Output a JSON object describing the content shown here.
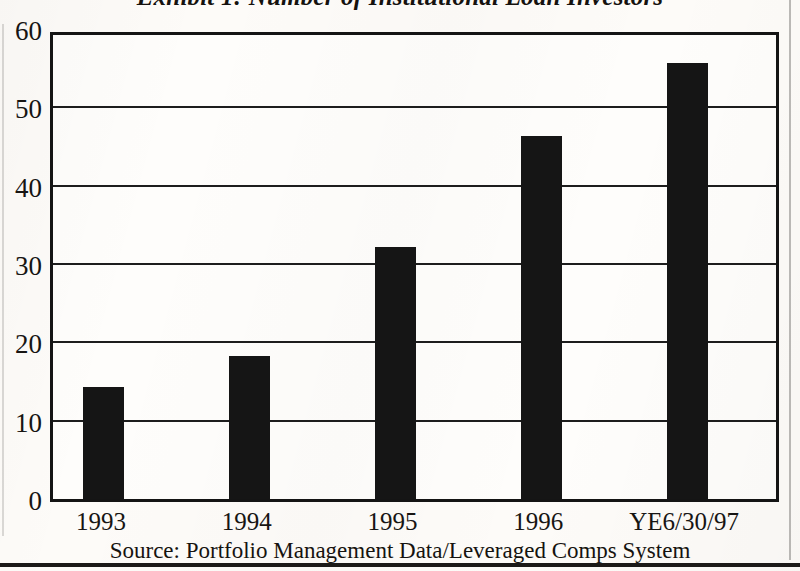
{
  "document": {
    "title": "Exhibit 1: Number of Institutional Loan Investors",
    "source_note": "Source: Portfolio Management Data/Leveraged Comps System"
  },
  "chart_data": {
    "type": "bar",
    "title": "Exhibit 1: Number of Institutional Loan Investors",
    "subtitle": "",
    "categories": [
      "1993",
      "1994",
      "1995",
      "1996",
      "YE6/30/97"
    ],
    "values": [
      14.3,
      18.3,
      32.2,
      46.3,
      55.6
    ],
    "series": [
      {
        "name": "Number of Institutional Loan Investors",
        "values": [
          14.3,
          18.3,
          32.2,
          46.3,
          55.6
        ]
      }
    ],
    "xlabel": "",
    "ylabel": "",
    "ylim": [
      0,
      60
    ],
    "yticks": [
      0,
      10,
      20,
      30,
      40,
      50,
      60
    ],
    "ytick_labels": [
      "0",
      "10",
      "20",
      "30",
      "40",
      "50",
      "60"
    ],
    "grid": true,
    "grid_axis": "y",
    "legend": false,
    "legend_position": "none",
    "bar_color": "#151515",
    "plot_background": "#fefdfb",
    "axis_color": "#141414",
    "annotations": [
      "Source: Portfolio Management Data/Leveraged Comps System"
    ]
  },
  "colors": {
    "bar": "#151515",
    "frame": "#141414",
    "gridline": "#1d1d1d",
    "page_background": "#fdfbf8",
    "text": "#171513"
  }
}
